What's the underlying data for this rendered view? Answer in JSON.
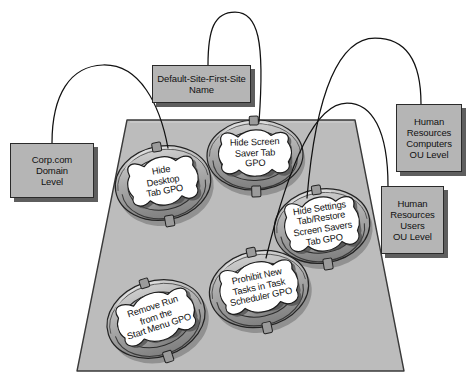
{
  "diagram": {
    "colors": {
      "box_fill": "#b5b5b5",
      "box_shadow": "#5e5e5e",
      "box_border": "#2a2a2a",
      "container_fill": "#bcbcbc",
      "container_border": "#3a3a3a",
      "node_ring": "#a8a8a8",
      "node_scroll": "#ffffff",
      "edge": "#111111"
    },
    "container": {
      "name": "domain-container-trapezoid",
      "points": "127,120 355,120 404,371 77,371"
    },
    "callouts": [
      {
        "id": "corp-domain-level",
        "label": "Corp.com\nDomain\nLevel",
        "x": 10,
        "y": 143,
        "w": 84,
        "h": 55
      },
      {
        "id": "default-site-first-site-name",
        "label": "Default-Site-First-Site\nName",
        "x": 152,
        "y": 65,
        "w": 99,
        "h": 38
      },
      {
        "id": "hr-computers-ou-level",
        "label": "Human\nResources\nComputers\nOU Level",
        "x": 396,
        "y": 104,
        "w": 66,
        "h": 68
      },
      {
        "id": "hr-users-ou-level",
        "label": "Human\nResources\nUsers\nOU Level",
        "x": 381,
        "y": 186,
        "w": 63,
        "h": 68
      }
    ],
    "gpos": [
      {
        "id": "hide-desktop-tab-gpo",
        "label": "Hide\nDesktop\nTab GPO",
        "cx": 163,
        "cy": 183,
        "rx": 48,
        "ry": 37,
        "rot": -10,
        "cap_w": 72,
        "cap_h": 50,
        "cap_dx": 0,
        "cap_dy": -2,
        "nub_top": true,
        "nub_bottom": true
      },
      {
        "id": "hide-screen-saver-tab-gpo",
        "label": "Hide Screen\nSaver Tab\nGPO",
        "cx": 255,
        "cy": 155,
        "rx": 48,
        "ry": 35,
        "rot": -2,
        "cap_w": 74,
        "cap_h": 48,
        "cap_dx": 0,
        "cap_dy": -2,
        "nub_top": true,
        "nub_bottom": true
      },
      {
        "id": "hide-settings-tab-restore-screen-savers-tab-gpo",
        "label": "Hide Settings\nTab/Restore\nScreen Savers\nTab GPO",
        "cx": 322,
        "cy": 226,
        "rx": 48,
        "ry": 37,
        "rot": -9,
        "cap_w": 76,
        "cap_h": 56,
        "cap_dx": 0,
        "cap_dy": -2,
        "nub_top": true,
        "nub_bottom": true
      },
      {
        "id": "prohibit-new-tasks-in-task-scheduler-gpo",
        "label": "Prohibit New\nTasks in Task\nScheduler GPO",
        "cx": 259,
        "cy": 289,
        "rx": 50,
        "ry": 38,
        "rot": -12,
        "cap_w": 80,
        "cap_h": 52,
        "cap_dx": 0,
        "cap_dy": -2,
        "nub_top": true,
        "nub_bottom": true
      },
      {
        "id": "remove-run-from-the-start-menu-gpo",
        "label": "Remove Run\nfrom the\nStart Menu GPO",
        "cx": 156,
        "cy": 319,
        "rx": 50,
        "ry": 38,
        "rot": -18,
        "cap_w": 80,
        "cap_h": 50,
        "cap_dx": 0,
        "cap_dy": -2,
        "nub_top": true,
        "nub_bottom": true
      }
    ],
    "edges": [
      {
        "id": "edge-corp-to-hide-desktop",
        "from": "corp-domain-level",
        "to": "hide-desktop-tab-gpo",
        "path": "M 52,143 C 52,95 70,66 103,65 C 140,64 160,105 168,148"
      },
      {
        "id": "edge-site-to-hide-screen-saver",
        "from": "default-site-first-site-name",
        "to": "hide-screen-saver-tab-gpo",
        "path": "M 208,65 C 208,30 214,12 235,12 C 258,12 265,40 259,122"
      },
      {
        "id": "edge-hr-computers-to-hide-settings",
        "from": "hr-computers-ou-level",
        "to": "hide-settings-tab-restore-screen-savers-tab-gpo",
        "path": "M 421,104 C 421,60 405,38 375,38 C 340,38 316,90 307,198"
      },
      {
        "id": "edge-hr-users-to-prohibit-new-tasks",
        "from": "hr-users-ou-level",
        "to": "prohibit-new-tasks-in-task-scheduler-gpo",
        "path": "M 388,186 C 388,130 372,103 347,103 C 316,103 290,160 266,258"
      }
    ]
  }
}
